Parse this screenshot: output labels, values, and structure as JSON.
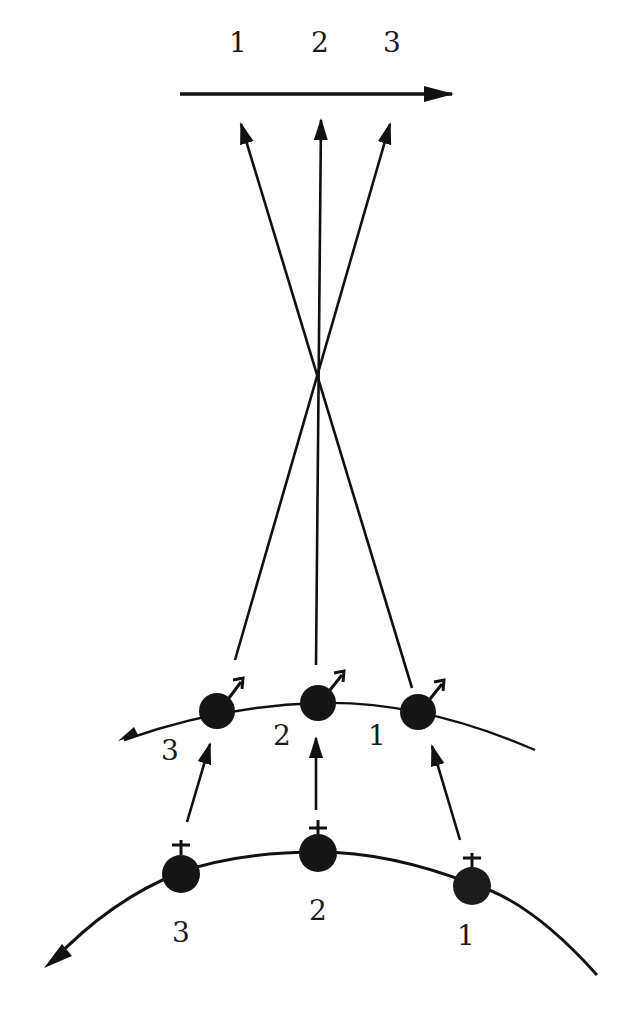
{
  "diagram": {
    "ink_color": "#111111",
    "background": "#ffffff",
    "top_axis": {
      "labels": [
        "1",
        "2",
        "3"
      ],
      "direction": "left-to-right"
    },
    "crossing_point": {
      "x": 318,
      "y": 368
    },
    "middle_arc": {
      "marker": "male-arrow",
      "nodes": [
        {
          "label": "3",
          "x": 217,
          "y": 711
        },
        {
          "label": "2",
          "x": 318,
          "y": 703
        },
        {
          "label": "1",
          "x": 418,
          "y": 712
        }
      ]
    },
    "bottom_arc": {
      "marker": "plus-cross",
      "nodes": [
        {
          "label": "3",
          "x": 181,
          "y": 874
        },
        {
          "label": "2",
          "x": 318,
          "y": 853
        },
        {
          "label": "1",
          "x": 472,
          "y": 886
        }
      ]
    }
  }
}
